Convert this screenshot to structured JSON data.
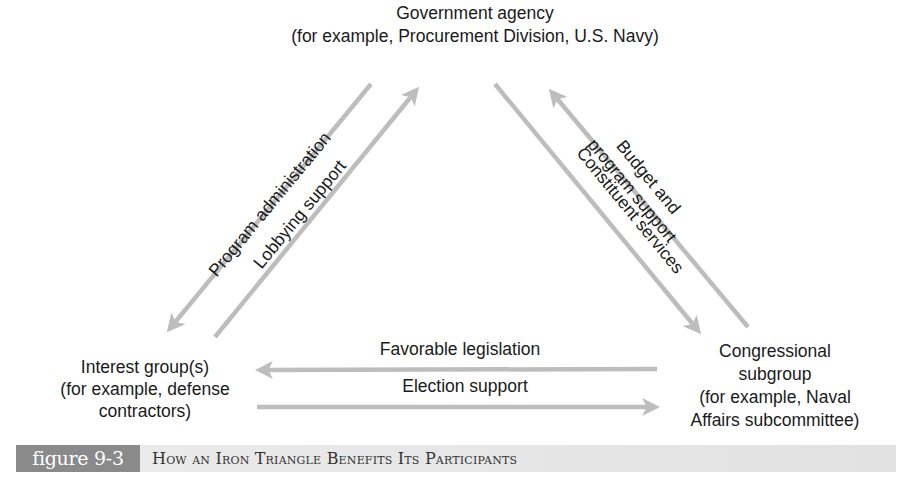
{
  "nodes": {
    "top": {
      "line1": "Government agency",
      "line2": "(for example, Procurement Division, U.S. Navy)"
    },
    "left": {
      "line1": "Interest group(s)",
      "line2": "(for example, defense",
      "line3": "contractors)"
    },
    "right": {
      "line1": "Congressional",
      "line2": "subgroup",
      "line3": "(for example, Naval",
      "line4": "Affairs subcommittee)"
    }
  },
  "edges": {
    "program_administration": {
      "label": "Program administration",
      "from": "Government agency",
      "to": "Interest group(s)"
    },
    "lobbying_support": {
      "label": "Lobbying support",
      "from": "Interest group(s)",
      "to": "Government agency"
    },
    "constituent_services": {
      "label": "Constituent services",
      "from": "Government agency",
      "to": "Congressional subgroup"
    },
    "budget_support": {
      "label_line1": "Budget and",
      "label_line2": "program support",
      "from": "Congressional subgroup",
      "to": "Government agency"
    },
    "favorable_legislation": {
      "label": "Favorable legislation",
      "from": "Congressional subgroup",
      "to": "Interest group(s)"
    },
    "election_support": {
      "label": "Election support",
      "from": "Interest group(s)",
      "to": "Congressional subgroup"
    }
  },
  "caption": {
    "figure_number": "figure 9-3",
    "title": "How an Iron Triangle Benefits Its Participants"
  },
  "colors": {
    "arrow": "#bdbdbd",
    "badge": "#8a8a8a",
    "caption_bar": "#e6e6e6"
  }
}
